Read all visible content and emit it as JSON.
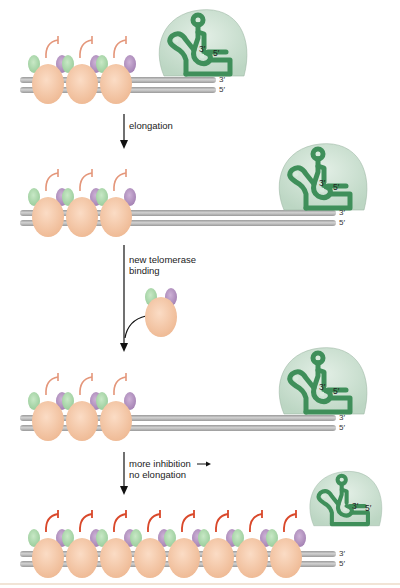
{
  "figure": {
    "type": "telomere length regulation by protein counting",
    "colors": {
      "dna_strand": "#b9b9b9",
      "dna_strand_edge": "#8f8f8f",
      "core_protein": "#f5c6a5",
      "green_subunit": "#a9d8a8",
      "purple_subunit": "#b594c0",
      "inhibition_signal_weak": "#e4967a",
      "inhibition_signal_strong": "#d9482a",
      "telomerase_body": "#cfe3d4",
      "telomerase_rna": "#3f8f5a",
      "arrow": "#111111",
      "bottom_rule": "#f1e4d6"
    },
    "strand_labels": {
      "top": "3′",
      "bottom": "5′"
    },
    "telomerase_labels": {
      "three_prime": "3′",
      "five_prime": "5′"
    },
    "steps": [
      {
        "label_lines": [
          "elongation"
        ]
      },
      {
        "label_lines": [
          "new telomerase",
          "binding"
        ]
      },
      {
        "label_lines": [
          "more inhibition →",
          "no elongation"
        ]
      }
    ],
    "panels": [
      {
        "name": "initial",
        "bound_protein_count": 3,
        "signal": "weak",
        "telomerase_position": "at end, engaged"
      },
      {
        "name": "after-elongation",
        "bound_protein_count": 3,
        "signal": "weak",
        "telomerase_position": "at extended end"
      },
      {
        "name": "new-binding",
        "bound_protein_count": 3,
        "signal": "weak",
        "telomerase_position": "at extended end",
        "incoming_protein": 1
      },
      {
        "name": "inhibited",
        "bound_protein_count": 8,
        "signal": "strong",
        "telomerase_position": "released from end"
      }
    ]
  }
}
